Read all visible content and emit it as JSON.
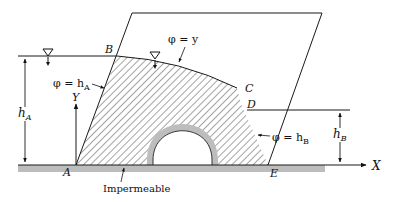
{
  "figure": {
    "type": "seepage-through-dam",
    "points": {
      "A": "A",
      "B": "B",
      "C": "C",
      "D": "D",
      "E": "E"
    },
    "axes": {
      "x": "X",
      "y": "Y"
    },
    "labels": {
      "phi_y": "φ = y",
      "phi_hA_sym": "φ = h",
      "phi_hA_sub": "A",
      "phi_hB_sym": "φ = h",
      "phi_hB_sub": "B",
      "hA_sym": "h",
      "hA_sub": "A",
      "hB_sym": "h",
      "hB_sub": "B",
      "impermeable": "Impermeable"
    },
    "colors": {
      "line": "#1a1a1a",
      "hatch": "#333333",
      "ground": "#b9b9b9"
    }
  }
}
